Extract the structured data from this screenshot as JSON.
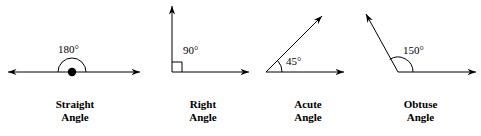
{
  "diagram": {
    "stroke_color": "#000000",
    "background_color": "#ffffff",
    "figures": [
      {
        "id": "straight",
        "angle_value": "180°",
        "caption_line1": "Straight",
        "caption_line2": "Angle",
        "vertex_marker": "filled-dot",
        "arc_type": "semicircle",
        "rays": [
          {
            "direction": "left",
            "arrowhead": true
          },
          {
            "direction": "right",
            "arrowhead": true
          }
        ]
      },
      {
        "id": "right",
        "angle_value": "90°",
        "caption_line1": "Right",
        "caption_line2": "Angle",
        "vertex_marker": "square",
        "arc_type": "none",
        "rays": [
          {
            "direction": "up",
            "arrowhead": true
          },
          {
            "direction": "right",
            "arrowhead": true
          }
        ]
      },
      {
        "id": "acute",
        "angle_value": "45°",
        "caption_line1": "Acute",
        "caption_line2": "Angle",
        "vertex_marker": "none",
        "arc_type": "small-arc",
        "rays": [
          {
            "direction": "up-right-45",
            "arrowhead": true
          },
          {
            "direction": "right",
            "arrowhead": true
          }
        ]
      },
      {
        "id": "obtuse",
        "angle_value": "150°",
        "caption_line1": "Obtuse",
        "caption_line2": "Angle",
        "vertex_marker": "none",
        "arc_type": "wide-arc",
        "rays": [
          {
            "direction": "up-left-150",
            "arrowhead": true
          },
          {
            "direction": "right",
            "arrowhead": true
          }
        ]
      }
    ]
  }
}
